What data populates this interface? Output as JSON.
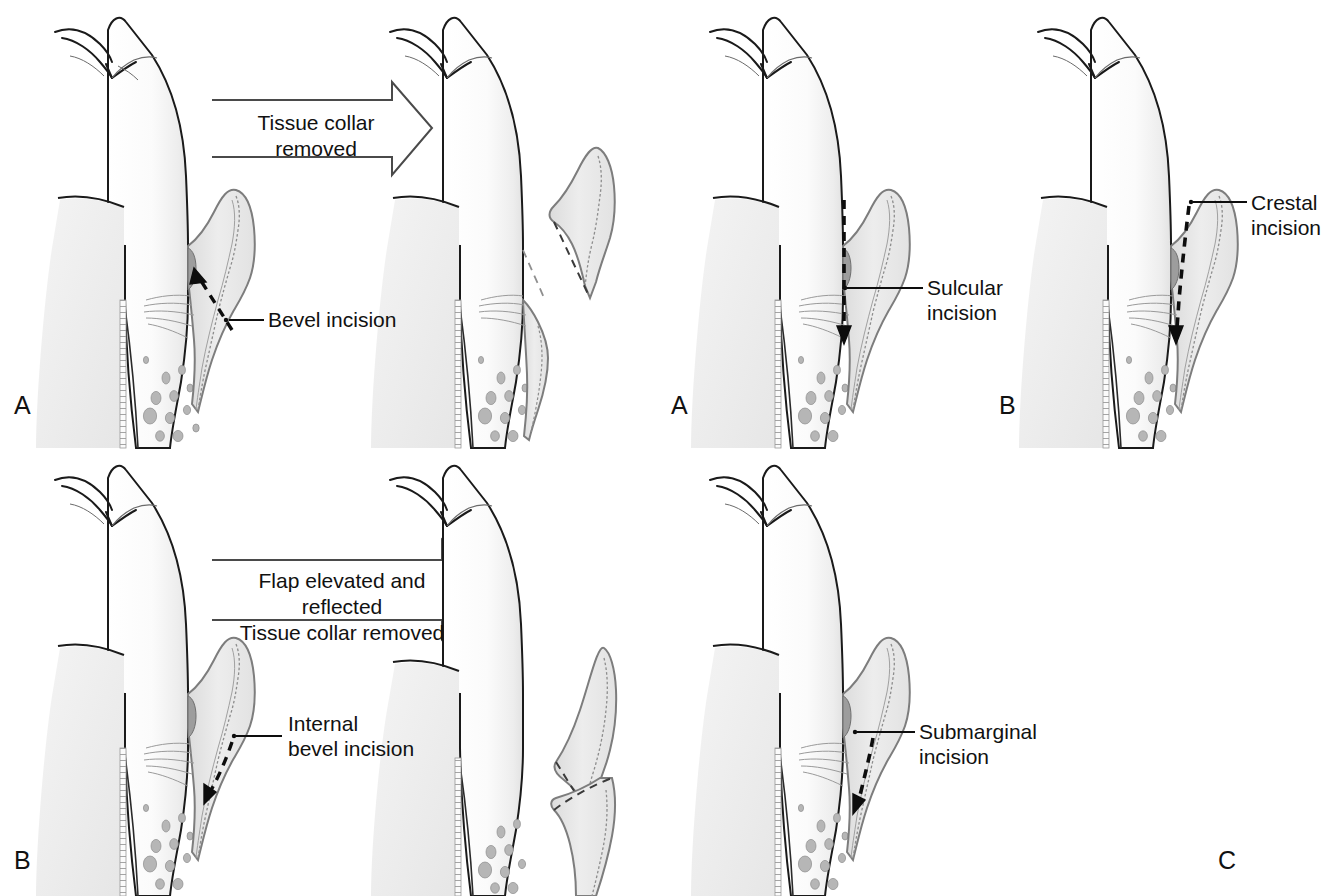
{
  "figure": {
    "background_color": "#ffffff",
    "ink_color": "#111111",
    "tissue_fill": "#e8e8e8",
    "tissue_outline": "#8a8a8a",
    "tooth_fill": "#fdfdfd",
    "bone_fill": "#f1f1f1"
  },
  "panels": [
    {
      "id": "panel-a-bevel",
      "letter": "A",
      "process_arrow": {
        "label": "Tissue collar\nremoved",
        "direction": "right",
        "style": "hollow-outline"
      },
      "callouts": [
        {
          "label": "Bevel incision",
          "leader": "horizontal-line"
        }
      ],
      "incision_marker": "dashed-arrow"
    },
    {
      "id": "panel-a-sulcular",
      "letter": "A",
      "process_arrow": null,
      "callouts": [
        {
          "label": "Sulcular\nincision",
          "leader": "horizontal-line"
        }
      ],
      "incision_marker": "dashed-arrow"
    },
    {
      "id": "panel-b-crestal",
      "letter": "B",
      "process_arrow": null,
      "callouts": [
        {
          "label": "Crestal\nincision",
          "leader": "horizontal-line"
        }
      ],
      "incision_marker": "dashed-arrow"
    },
    {
      "id": "panel-b-internal",
      "letter": "B",
      "process_arrow": {
        "label": "Flap elevated and reflected\nTissue collar removed",
        "direction": "right",
        "style": "hollow-outline"
      },
      "callouts": [
        {
          "label": "Internal\nbevel incision",
          "leader": "horizontal-line"
        }
      ],
      "incision_marker": "dashed-arrow"
    },
    {
      "id": "panel-c-submarginal",
      "letter": "C",
      "process_arrow": null,
      "callouts": [
        {
          "label": "Submarginal\nincision",
          "leader": "horizontal-line"
        }
      ],
      "incision_marker": "dashed-arrow"
    }
  ],
  "labels": {
    "bevel_incision": "Bevel incision",
    "sulcular_incision": "Sulcular\nincision",
    "crestal_incision": "Crestal\nincision",
    "internal_bevel_incision": "Internal\nbevel incision",
    "submarginal_incision": "Submarginal\nincision",
    "tissue_collar_removed": "Tissue collar\nremoved",
    "flap_elevated_reflected": "Flap elevated and reflected\nTissue collar removed",
    "letter_a1": "A",
    "letter_a2": "A",
    "letter_b1": "B",
    "letter_b2": "B",
    "letter_c": "C"
  }
}
